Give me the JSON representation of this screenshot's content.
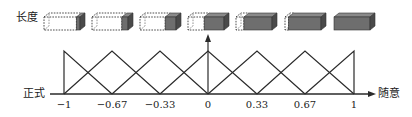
{
  "labels": {
    "length": "长度",
    "formal": "正式",
    "casual": "随意"
  },
  "axis": {
    "ticks": [
      {
        "value": -1,
        "label": "−1",
        "x": 64
      },
      {
        "value": -0.67,
        "label": "−0.67",
        "x": 112
      },
      {
        "value": -0.33,
        "label": "−0.33",
        "x": 160
      },
      {
        "value": 0,
        "label": "0",
        "x": 208
      },
      {
        "value": 0.33,
        "label": "0.33",
        "x": 257
      },
      {
        "value": 0.67,
        "label": "0.67",
        "x": 305
      },
      {
        "value": 1,
        "label": "1",
        "x": 354
      }
    ]
  },
  "boxes": [
    {
      "index": 0,
      "x": 44,
      "solid_fraction": 0.1
    },
    {
      "index": 1,
      "x": 92,
      "solid_fraction": 0.17
    },
    {
      "index": 2,
      "x": 140,
      "solid_fraction": 0.3
    },
    {
      "index": 3,
      "x": 188,
      "solid_fraction": 0.55
    },
    {
      "index": 4,
      "x": 236,
      "solid_fraction": 0.78
    },
    {
      "index": 5,
      "x": 285,
      "solid_fraction": 0.9
    },
    {
      "index": 6,
      "x": 334,
      "solid_fraction": 1.0
    }
  ],
  "colors": {
    "line": "#2a2a2a",
    "solid_face": "#6e6e6e",
    "solid_top": "#8a8a8a",
    "solid_side": "#4a4a4a",
    "dashed": "#3a3a3a"
  }
}
